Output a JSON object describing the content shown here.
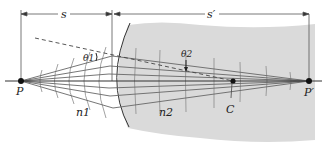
{
  "figure": {
    "labels": {
      "s": "s",
      "s_prime": "s′",
      "theta1": "θ1",
      "theta2": "θ2",
      "P": "P",
      "P_prime": "P′",
      "C": "C",
      "n1": "n1",
      "n2": "n2"
    },
    "colors": {
      "medium2_fill": "#d9d9d9",
      "ray": "#555555",
      "axis": "#333333",
      "wavefront": "#8a8a8a",
      "dashed_normal": "#444444",
      "point": "#111111"
    },
    "points": {
      "P": [
        21,
        81
      ],
      "C": [
        233,
        81
      ],
      "P_prime": [
        309,
        81
      ],
      "surface_vertex_x": 113
    }
  }
}
